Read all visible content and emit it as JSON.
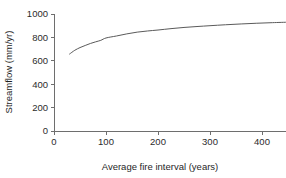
{
  "chart_data": {
    "type": "line",
    "title": "",
    "subtitle": "",
    "xlabel": "Average fire interval (years)",
    "ylabel": "Streamflow (mm/yr)",
    "xlim": [
      0,
      455
    ],
    "ylim": [
      0,
      1000
    ],
    "xticks": [
      0,
      100,
      200,
      300,
      400
    ],
    "yticks": [
      0,
      200,
      400,
      600,
      800,
      1000
    ],
    "xtick_labels": [
      "0",
      "100",
      "200",
      "300",
      "400"
    ],
    "ytick_labels": [
      "0",
      "200",
      "400",
      "600",
      "800",
      "1000"
    ],
    "grid": false,
    "legend": false,
    "legend_position": "none",
    "annotations": [],
    "series": [
      {
        "name": "Streamflow vs average fire interval",
        "color": "#5a5a5a",
        "x": [
          30,
          40,
          50,
          60,
          70,
          80,
          90,
          100,
          120,
          140,
          160,
          180,
          200,
          225,
          250,
          275,
          300,
          330,
          360,
          390,
          420,
          450
        ],
        "y": [
          658,
          690,
          713,
          731,
          748,
          762,
          775,
          795,
          812,
          830,
          845,
          855,
          863,
          875,
          885,
          893,
          900,
          908,
          915,
          921,
          926,
          930
        ]
      }
    ]
  },
  "axes": {
    "y_axis_name": "streamflow-axis",
    "x_axis_name": "fire-interval-axis"
  }
}
